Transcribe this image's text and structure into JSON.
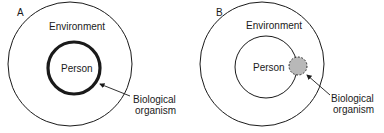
{
  "panels": [
    {
      "id": "A",
      "label": "A",
      "outer_label": "Environment",
      "inner_label": "Person",
      "annotation_line1": "Biological",
      "annotation_line2": "organism"
    },
    {
      "id": "B",
      "label": "B",
      "outer_label": "Environment",
      "inner_label": "Person",
      "annotation_line1": "Biological",
      "annotation_line2": "organism"
    }
  ],
  "colors": {
    "stroke": "#1a1a1a",
    "organism_fill": "#b8b8b8"
  }
}
